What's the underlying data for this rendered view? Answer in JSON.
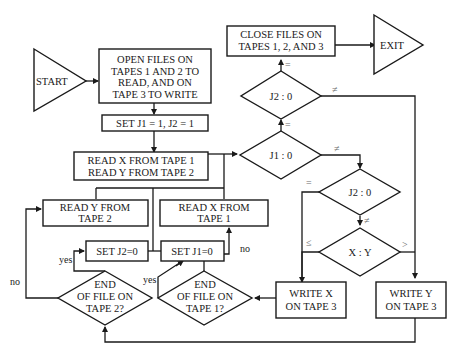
{
  "diagram": {
    "start": "START",
    "exit": "EXIT",
    "open_files": [
      "OPEN FILES ON",
      "TAPES 1 AND 2 TO",
      "READ, AND ON",
      "TAPE 3 TO WRITE"
    ],
    "set_j": "SET J1 = 1, J2 = 1",
    "read_xy": [
      "READ X FROM TAPE 1",
      "READ Y FROM TAPE 2"
    ],
    "close_files": [
      "CLOSE FILES ON",
      "TAPES 1, 2, AND 3"
    ],
    "dec_j2_top": "J2  :  0",
    "dec_j1": "J1  :  0",
    "dec_j2_mid": "J2  :  0",
    "dec_xy": "X  :  Y",
    "read_y": [
      "READ Y FROM",
      "TAPE 2"
    ],
    "read_x": [
      "READ X FROM",
      "TAPE 1"
    ],
    "set_j2_zero": "SET J2=0",
    "set_j1_zero": "SET J1=0",
    "eof_tape2": [
      "END",
      "OF FILE ON",
      "TAPE 2?"
    ],
    "eof_tape1": [
      "END",
      "OF FILE ON",
      "TAPE 1?"
    ],
    "write_x": [
      "WRITE X",
      "ON TAPE 3"
    ],
    "write_y": [
      "WRITE Y",
      "ON TAPE 3"
    ],
    "labels": {
      "eq": "=",
      "neq": "≠",
      "le": "≤",
      "gt": ">",
      "yes": "yes",
      "no": "no"
    }
  }
}
